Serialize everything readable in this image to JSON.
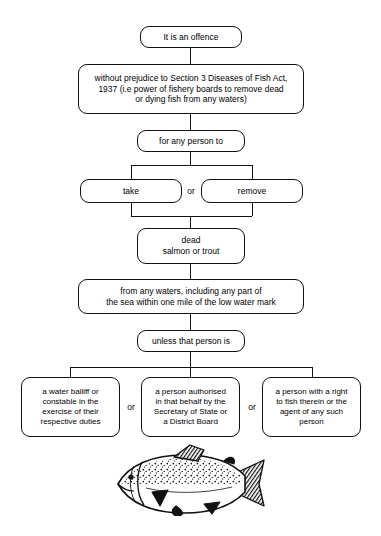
{
  "diagram": {
    "nodes": {
      "offence": "It is an offence",
      "without_prejudice": "without prejudice to Section 3 Diseases of Fish Act,\n1937 (i.e power of fishery boards to remove dead\nor dying fish from any waters)",
      "for_any_person": "for any person to",
      "take": "take",
      "remove": "remove",
      "dead_fish": "dead\nsalmon or trout",
      "from_any_waters": "from any waters, including any part of\nthe sea within one mile of the low water mark",
      "unless": "unless that person is",
      "exception_1": "a water bailiff or\nconstable in the\nexercise of their\nrespective duties",
      "exception_2": "a person authorised\nin that behalf by the\nSecretary of State or\na District Board",
      "exception_3": "a person with a right\nto fish therein or the\nagent of any such\nperson"
    },
    "connectors": {
      "or_take_remove": "or",
      "or_exception_1_2": "or",
      "or_exception_2_3": "or"
    },
    "illustration": {
      "name": "salmon-trout-illustration",
      "caption": "salmon or trout line drawing"
    },
    "colors": {
      "line": "#111111",
      "background": "#ffffff",
      "text": "#000000"
    }
  }
}
